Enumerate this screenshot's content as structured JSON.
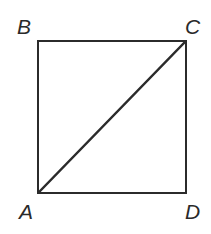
{
  "figure": {
    "type": "geometry-diagram",
    "background_color": "#ffffff",
    "stroke_color": "#2b2b2b",
    "label_color": "#2a2a2a",
    "square": {
      "x": 38,
      "y": 41,
      "width": 148,
      "height": 152,
      "stroke_width": 2.6
    },
    "diagonal": {
      "name": "diagonal-AC",
      "from": "A",
      "to": "C",
      "x1": 39,
      "y1": 192,
      "x2": 185,
      "y2": 42,
      "stroke_width": 2.3
    },
    "vertices": [
      {
        "label": "B",
        "position": "top-left"
      },
      {
        "label": "C",
        "position": "top-right"
      },
      {
        "label": "A",
        "position": "bottom-left"
      },
      {
        "label": "D",
        "position": "bottom-right"
      }
    ]
  }
}
